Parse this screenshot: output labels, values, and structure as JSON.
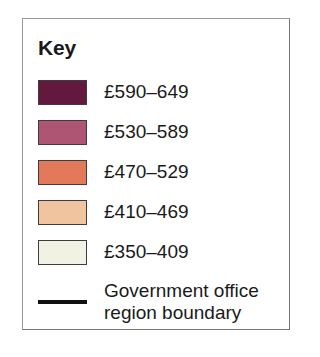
{
  "legend": {
    "title": "Key",
    "items": [
      {
        "label": "£590–649",
        "color": "#63183D"
      },
      {
        "label": "£530–589",
        "color": "#AD5572"
      },
      {
        "label": "£470–529",
        "color": "#E2795B"
      },
      {
        "label": "£410–469",
        "color": "#EFC49E"
      },
      {
        "label": "£350–409",
        "color": "#F1F1E4"
      }
    ],
    "boundary": {
      "line_color": "#111111",
      "label_line1": "Government office",
      "label_line2": "region boundary"
    }
  },
  "chart_data": {
    "type": "table",
    "title": "Key",
    "categories": [
      "£590–649",
      "£530–589",
      "£470–529",
      "£410–469",
      "£350–409"
    ],
    "values": [
      {
        "range_label": "£590–649",
        "min": 590,
        "max": 649,
        "color": "#63183D"
      },
      {
        "range_label": "£530–589",
        "min": 530,
        "max": 589,
        "color": "#AD5572"
      },
      {
        "range_label": "£470–529",
        "min": 470,
        "max": 529,
        "color": "#E2795B"
      },
      {
        "range_label": "£410–469",
        "min": 410,
        "max": 469,
        "color": "#EFC49E"
      },
      {
        "range_label": "£350–409",
        "min": 350,
        "max": 409,
        "color": "#F1F1E4"
      }
    ],
    "annotations": [
      "Government office region boundary"
    ],
    "xlabel": "",
    "ylabel": "",
    "legend_position": "standalone"
  }
}
